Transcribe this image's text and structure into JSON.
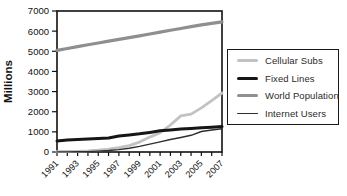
{
  "chart_data": {
    "type": "line",
    "ylabel": "Millions",
    "xlabel": "",
    "grid": false,
    "legend_position": "right-outside",
    "ylim": [
      0,
      7000
    ],
    "y_ticks": [
      0,
      1000,
      2000,
      3000,
      4000,
      5000,
      6000,
      7000
    ],
    "x": [
      1991,
      1992,
      1993,
      1994,
      1995,
      1996,
      1997,
      1998,
      1999,
      2000,
      2001,
      2002,
      2003,
      2004,
      2005,
      2006,
      2007
    ],
    "x_tick_labels": [
      "1991",
      "1993",
      "1995",
      "1997",
      "1999",
      "2001",
      "2003",
      "2005",
      "2007"
    ],
    "axis_color": "#111111",
    "series": [
      {
        "name": "Cellular Subs",
        "color": "#c2c2c2",
        "line_width": 2.8,
        "values": [
          16,
          25,
          35,
          55,
          90,
          140,
          215,
          320,
          490,
          740,
          960,
          1340,
          1790,
          1880,
          2190,
          2550,
          2930
        ]
      },
      {
        "name": "Fixed Lines",
        "color": "#161616",
        "line_width": 3.0,
        "values": [
          550,
          590,
          620,
          645,
          665,
          695,
          790,
          850,
          905,
          975,
          1050,
          1090,
          1135,
          1170,
          1200,
          1230,
          1260
        ]
      },
      {
        "name": "World Population",
        "color": "#8f8f8f",
        "line_width": 3.2,
        "values": [
          5050,
          5140,
          5230,
          5320,
          5410,
          5500,
          5590,
          5680,
          5770,
          5860,
          5950,
          6040,
          6130,
          6220,
          6310,
          6390,
          6460
        ]
      },
      {
        "name": "Internet Users",
        "color": "#2e2e2e",
        "line_width": 1.4,
        "values": [
          4,
          7,
          10,
          21,
          45,
          75,
          120,
          185,
          280,
          390,
          500,
          620,
          720,
          830,
          1020,
          1090,
          1150
        ]
      }
    ]
  }
}
